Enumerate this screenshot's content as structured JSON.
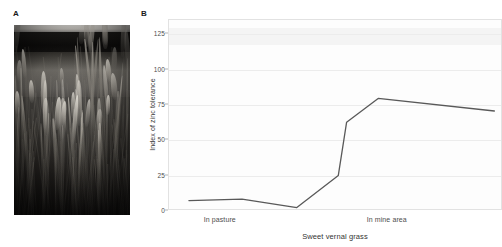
{
  "figure": {
    "panel_a": {
      "label": "A",
      "image_alt": "sweet-vernal-grass-photo"
    },
    "panel_b": {
      "label": "B"
    }
  },
  "chart_data": {
    "type": "line",
    "title": "",
    "xlabel": "Sweet vernal grass",
    "ylabel": "Index of zinc tolerance",
    "ylim": [
      0,
      135
    ],
    "yticks": [
      0,
      25,
      50,
      75,
      100,
      125
    ],
    "ytick_labels": [
      "0",
      "25",
      "50",
      "75",
      "100",
      "125"
    ],
    "xlim": [
      0,
      10
    ],
    "xtick_positions": [
      1.55,
      6.55
    ],
    "xtick_labels": [
      "In pasture",
      "In mine area"
    ],
    "grid": true,
    "legend": false,
    "line_color": "#595959",
    "series": [
      {
        "name": "Index of zinc tolerance",
        "x": [
          0.6,
          2.2,
          3.85,
          5.1,
          5.35,
          6.3,
          9.8
        ],
        "values": [
          6,
          7,
          1,
          24,
          62,
          79,
          70
        ]
      }
    ]
  }
}
